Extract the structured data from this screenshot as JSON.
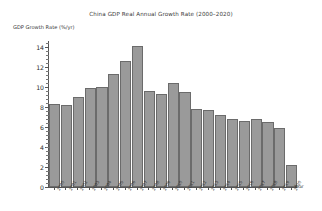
{
  "chart_data": {
    "type": "bar",
    "title": "China GDP Real Annual Growth Rate (2000–2020)",
    "xlabel": "Year",
    "ylabel": "GDP Growth Rate (%/yr)",
    "categories": [
      "2000",
      "2001",
      "2002",
      "2003",
      "2004",
      "2005",
      "2006",
      "2007",
      "2008",
      "2009",
      "2010",
      "2011",
      "2012",
      "2013",
      "2014",
      "2015",
      "2016",
      "2017",
      "2018",
      "2019",
      "2020"
    ],
    "values": [
      8.3,
      8.25,
      9.05,
      9.95,
      10.05,
      11.35,
      12.65,
      14.15,
      9.6,
      9.35,
      10.45,
      9.5,
      7.85,
      7.75,
      7.25,
      6.8,
      6.6,
      6.8,
      6.55,
      5.95,
      2.2
    ],
    "ylim": [
      0,
      14.6
    ],
    "yticks": [
      0,
      2,
      4,
      6,
      8,
      10,
      12,
      14
    ],
    "yticklabels": [
      "0",
      "2",
      "4",
      "6",
      "8",
      "10",
      "12",
      "14"
    ],
    "minor_ticks": true,
    "grid": false,
    "legend": null,
    "bar_color": "#9a9a9a",
    "bar_edge_color": "#6b6b6b",
    "axis_color": "#555555",
    "background": "#ffffff"
  }
}
